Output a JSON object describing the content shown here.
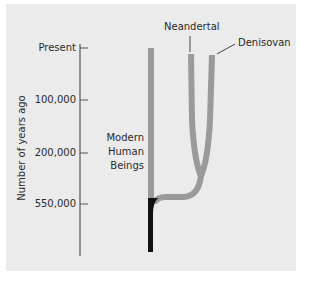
{
  "figure": {
    "axis_title": "Number of years ago",
    "ticks": [
      {
        "label": "Present",
        "y": 48
      },
      {
        "label": "100,000",
        "y": 100
      },
      {
        "label": "200,000",
        "y": 153
      },
      {
        "label": "550,000",
        "y": 204
      }
    ],
    "branches": {
      "neandertal": {
        "label": "Neandertal"
      },
      "denisovan": {
        "label": "Denisovan"
      },
      "modern": {
        "label_lines": [
          "Modern",
          "Human",
          "Beings"
        ]
      }
    },
    "colors": {
      "panel_background": "#ebebeb",
      "lineage_grey": "#9a9a9a",
      "ancestral_black": "#111111",
      "axis": "#555555",
      "text": "#2a2a2a"
    }
  }
}
